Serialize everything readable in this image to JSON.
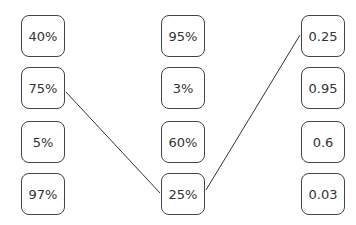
{
  "columns": [
    {
      "name": "left",
      "items": [
        "40%",
        "75%",
        "5%",
        "97%"
      ]
    },
    {
      "name": "middle",
      "items": [
        "95%",
        "3%",
        "60%",
        "25%"
      ]
    },
    {
      "name": "right",
      "items": [
        "0.25",
        "0.95",
        "0.6",
        "0.03"
      ]
    }
  ],
  "connections": [
    {
      "from": "left:75%",
      "to": "middle:25%"
    },
    {
      "from": "middle:25%",
      "to": "right:0.25"
    }
  ],
  "colors": {
    "border": "#444444",
    "text": "#333333",
    "line": "#333333",
    "background": "#ffffff"
  }
}
